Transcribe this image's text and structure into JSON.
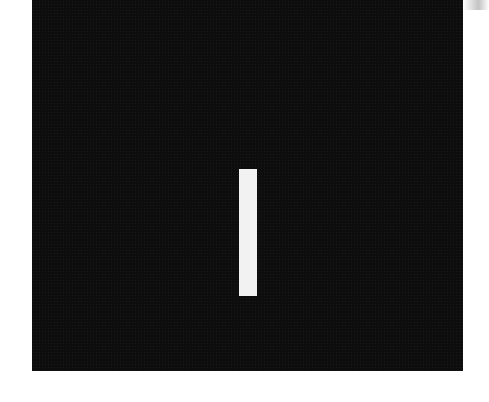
{
  "image": {
    "background_color": "#ffffff",
    "panel_color": "#0d0d0d",
    "bar_color": "#f2f2f2",
    "description": "Dark square with a single white vertical bar"
  }
}
